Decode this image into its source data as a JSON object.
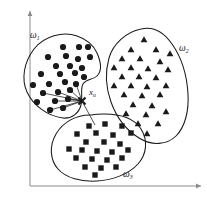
{
  "figure": {
    "background_color": "#ffffff",
    "ink_color": "#1a1a1a",
    "axis_color": "#8a8a8a"
  },
  "axes": {
    "y_axis": {
      "name": "vertical-axis",
      "x": 30,
      "y_top": 11,
      "y_bottom": 186,
      "arrow": "up"
    },
    "x_axis": {
      "name": "horizontal-axis",
      "y": 186,
      "x_left": 30,
      "x_right": 201,
      "arrow": "right"
    }
  },
  "labels": {
    "cluster1": {
      "base": "ω",
      "sub": "1",
      "x": 30,
      "y": 31
    },
    "cluster2": {
      "base": "ω",
      "sub": "2",
      "x": 179,
      "y": 44
    },
    "cluster3": {
      "base": "ω",
      "sub": "3",
      "x": 123,
      "y": 170
    },
    "query_point": {
      "base": "x",
      "sub": "u",
      "x": 89,
      "y": 88
    }
  },
  "query_point": {
    "name": "x-u-marker",
    "x": 82,
    "y": 101,
    "glyph": "cross-x",
    "size": 7
  },
  "clusters": [
    {
      "id": "cluster-1",
      "label": "ω₁",
      "marker": "circle",
      "boundary": "M 77 36 C 63 31 44 36 34 49 C 24 62 21 79 27 92 C 33 105 47 116 63 118 C 72 119 79 113 81 105 C 83 97 80 89 83 84 C 86 79 93 80 97 76 C 102 71 101 62 97 53 C 93 44 86 39 77 36 Z",
      "points": [
        {
          "x": 63,
          "y": 47
        },
        {
          "x": 79,
          "y": 47
        },
        {
          "x": 88,
          "y": 47
        },
        {
          "x": 48,
          "y": 57
        },
        {
          "x": 66,
          "y": 56
        },
        {
          "x": 78,
          "y": 59
        },
        {
          "x": 90,
          "y": 57
        },
        {
          "x": 56,
          "y": 66
        },
        {
          "x": 70,
          "y": 66
        },
        {
          "x": 82,
          "y": 68
        },
        {
          "x": 41,
          "y": 74
        },
        {
          "x": 60,
          "y": 74
        },
        {
          "x": 75,
          "y": 73
        },
        {
          "x": 84,
          "y": 77
        },
        {
          "x": 33,
          "y": 85
        },
        {
          "x": 49,
          "y": 84
        },
        {
          "x": 65,
          "y": 82
        },
        {
          "x": 76,
          "y": 84
        },
        {
          "x": 43,
          "y": 93
        },
        {
          "x": 58,
          "y": 92
        },
        {
          "x": 70,
          "y": 90
        },
        {
          "x": 37,
          "y": 102
        },
        {
          "x": 55,
          "y": 101
        },
        {
          "x": 68,
          "y": 99
        },
        {
          "x": 50,
          "y": 110
        },
        {
          "x": 63,
          "y": 108
        }
      ]
    },
    {
      "id": "cluster-2",
      "label": "ω₂",
      "marker": "triangle",
      "boundary": "M 141 29 C 126 32 113 44 109 58 C 105 72 106 88 111 102 C 116 116 126 130 139 138 C 152 146 167 145 176 136 C 185 127 189 111 188 94 C 187 77 182 58 172 44 C 163 31 153 26 141 29 Z",
      "points": [
        {
          "x": 144,
          "y": 40
        },
        {
          "x": 131,
          "y": 50
        },
        {
          "x": 156,
          "y": 50
        },
        {
          "x": 170,
          "y": 54
        },
        {
          "x": 122,
          "y": 59
        },
        {
          "x": 140,
          "y": 59
        },
        {
          "x": 160,
          "y": 62
        },
        {
          "x": 114,
          "y": 68
        },
        {
          "x": 131,
          "y": 68
        },
        {
          "x": 148,
          "y": 69
        },
        {
          "x": 168,
          "y": 70
        },
        {
          "x": 122,
          "y": 77
        },
        {
          "x": 139,
          "y": 77
        },
        {
          "x": 156,
          "y": 78
        },
        {
          "x": 114,
          "y": 86
        },
        {
          "x": 131,
          "y": 86
        },
        {
          "x": 147,
          "y": 87
        },
        {
          "x": 166,
          "y": 86
        },
        {
          "x": 124,
          "y": 95
        },
        {
          "x": 142,
          "y": 96
        },
        {
          "x": 160,
          "y": 95
        },
        {
          "x": 133,
          "y": 105
        },
        {
          "x": 152,
          "y": 106
        },
        {
          "x": 126,
          "y": 114
        },
        {
          "x": 146,
          "y": 115
        },
        {
          "x": 166,
          "y": 112
        },
        {
          "x": 138,
          "y": 124
        },
        {
          "x": 158,
          "y": 124
        },
        {
          "x": 147,
          "y": 134
        }
      ]
    },
    {
      "id": "cluster-3",
      "label": "ω₃",
      "marker": "square",
      "boundary": "M 92 115 C 77 114 63 122 56 134 C 49 146 50 160 58 169 C 66 178 81 182 97 181 C 113 180 129 174 138 164 C 147 154 148 140 141 129 C 134 118 120 114 104 114 C 100 114 96 114 92 115 Z",
      "points": [
        {
          "x": 89,
          "y": 126
        },
        {
          "x": 105,
          "y": 124
        },
        {
          "x": 122,
          "y": 126
        },
        {
          "x": 77,
          "y": 134
        },
        {
          "x": 96,
          "y": 133
        },
        {
          "x": 113,
          "y": 135
        },
        {
          "x": 131,
          "y": 133
        },
        {
          "x": 86,
          "y": 142
        },
        {
          "x": 104,
          "y": 142
        },
        {
          "x": 120,
          "y": 144
        },
        {
          "x": 69,
          "y": 149
        },
        {
          "x": 82,
          "y": 150
        },
        {
          "x": 97,
          "y": 151
        },
        {
          "x": 112,
          "y": 152
        },
        {
          "x": 128,
          "y": 150
        },
        {
          "x": 76,
          "y": 158
        },
        {
          "x": 92,
          "y": 159
        },
        {
          "x": 107,
          "y": 160
        },
        {
          "x": 122,
          "y": 158
        },
        {
          "x": 85,
          "y": 167
        },
        {
          "x": 101,
          "y": 168
        },
        {
          "x": 116,
          "y": 167
        },
        {
          "x": 95,
          "y": 175
        }
      ]
    }
  ],
  "arrows": {
    "name": "nearest-neighbor-arrows",
    "origin": {
      "x": 82,
      "y": 101
    },
    "targets": [
      {
        "x": 50,
        "y": 110
      },
      {
        "x": 43,
        "y": 93
      },
      {
        "x": 58,
        "y": 92
      },
      {
        "x": 55,
        "y": 101
      },
      {
        "x": 68,
        "y": 99
      },
      {
        "x": 63,
        "y": 108
      },
      {
        "x": 76,
        "y": 84
      },
      {
        "x": 70,
        "y": 90
      }
    ],
    "link_to_cluster3": {
      "x": 95,
      "y": 125
    }
  }
}
